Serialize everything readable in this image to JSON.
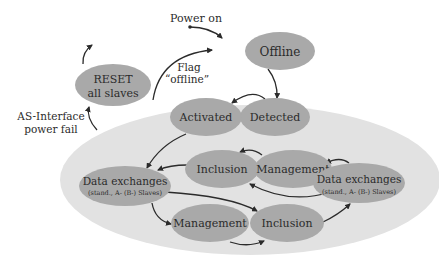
{
  "diagram": {
    "type": "state-diagram",
    "colors": {
      "background": "#ffffff",
      "region": "#e2e2e2",
      "state_fill": "#a9a9a9",
      "arrow": "#2b2b2b",
      "text": "#2b2b2b"
    },
    "labels": {
      "power_on": "Power on",
      "flag_line1": "Flag",
      "flag_line2": "“offline”",
      "as_interface_line1": "AS-Interface",
      "as_interface_line2": "power fail"
    },
    "states": {
      "offline": "Offline",
      "detected": "Detected",
      "activated": "Activated",
      "reset_line1": "RESET",
      "reset_line2": "all slaves",
      "inclusion_upper": "Inclusion",
      "management_upper": "Management",
      "data_left_line1": "Data exchanges",
      "data_left_line2": "(stand., A- (B-) Slaves)",
      "data_right_line1": "Data exchanges",
      "data_right_line2": "(stand., A- (B-) Slaves)",
      "management_lower": "Management",
      "inclusion_lower": "Inclusion"
    }
  }
}
